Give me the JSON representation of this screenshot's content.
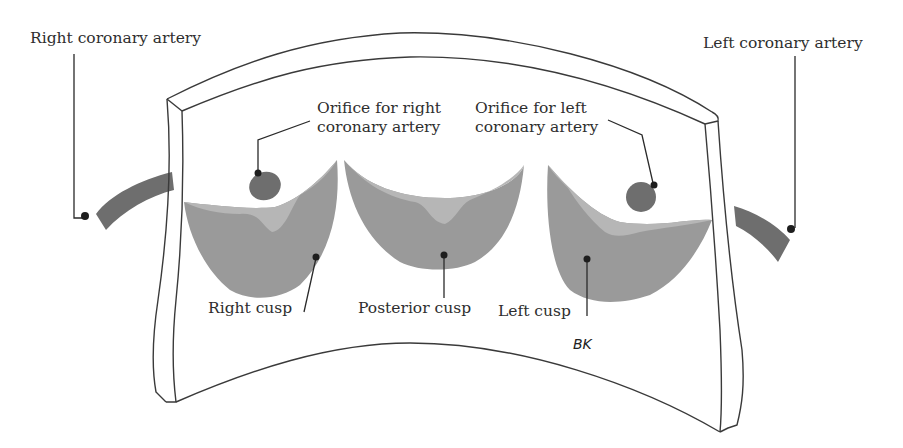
{
  "diagram": {
    "colors": {
      "cusp_body": "#9a9a9a",
      "cusp_margin": "#b6b6b6",
      "artery": "#6e6e6e",
      "orifice": "#6e6e6e",
      "frame_stroke": "#3a3a3a",
      "label_text": "#2e2e2e"
    },
    "labels": {
      "right_coronary_artery": "Right coronary artery",
      "left_coronary_artery": "Left coronary artery",
      "orifice_right_line1": "Orifice for right",
      "orifice_right_line2": "coronary artery",
      "orifice_left_line1": "Orifice for left",
      "orifice_left_line2": "coronary artery",
      "right_cusp": "Right cusp",
      "posterior_cusp": "Posterior cusp",
      "left_cusp": "Left cusp"
    },
    "signature": "BK"
  }
}
